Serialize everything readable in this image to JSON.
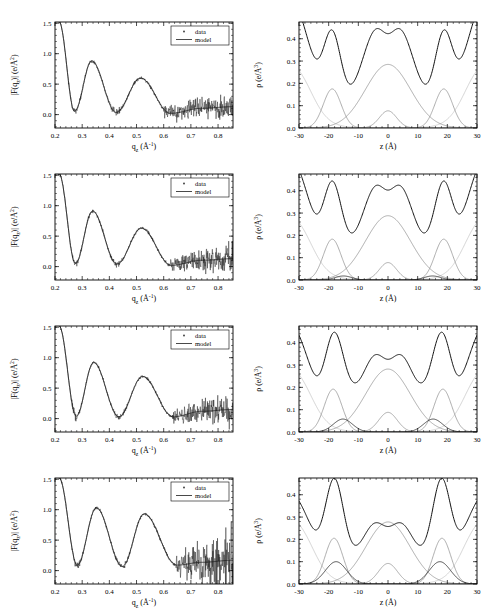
{
  "figure": {
    "rows": 4,
    "columns": 2,
    "width": 488,
    "height": 608
  },
  "colors": {
    "total_curve": "#111111",
    "component_curve": "#8a8a8a",
    "component_dark": "#222222",
    "component_light": "#c2c2c2",
    "axis": "#000000",
    "background": "#ffffff"
  },
  "legend": {
    "data_label": "data",
    "model_label": "model",
    "position": "top-right"
  },
  "left_axes": {
    "xlabel": "q",
    "xlabel_sub": "z",
    "xlabel_unit": "(Å",
    "xlabel_unit_sup": "-1",
    "xlabel_unit_close": ")",
    "xlabel_plain": "q_z (Å⁻¹)",
    "ylabel_plain": "|F(q_z)| (e/Å²)",
    "xticks": [
      "0.2",
      "0.3",
      "0.4",
      "0.5",
      "0.6",
      "0.7",
      "0.8"
    ],
    "xtick_values": [
      0.2,
      0.3,
      0.4,
      0.5,
      0.6,
      0.7,
      0.8
    ],
    "yticks": [
      "0.0",
      "0.5",
      "1.0",
      "1.5"
    ],
    "ytick_values": [
      0.0,
      0.5,
      1.0,
      1.5
    ],
    "xlim": [
      0.2,
      0.855
    ],
    "ylim": [
      -0.22,
      1.52
    ]
  },
  "right_axes": {
    "xlabel_plain": "z (Å)",
    "ylabel_plain": "ρ (e/Å³)",
    "xticks": [
      "-30",
      "-20",
      "-10",
      "0",
      "10",
      "20",
      "30"
    ],
    "xtick_values": [
      -30,
      -20,
      -10,
      0,
      10,
      20,
      30
    ],
    "yticks": [
      "0.0",
      "0.1",
      "0.2",
      "0.3",
      "0.4"
    ],
    "ytick_values": [
      0.0,
      0.1,
      0.2,
      0.3,
      0.4
    ],
    "xlim": [
      -30,
      30
    ],
    "ylim": [
      0.0,
      0.475
    ]
  },
  "chart_data": [
    {
      "id": "row1-left",
      "type": "line",
      "title": "",
      "xlabel": "q_z (Å⁻¹)",
      "ylabel": "|F(q_z)| (e/Å²)",
      "xlim": [
        0.2,
        0.855
      ],
      "ylim": [
        -0.22,
        1.52
      ],
      "grid": false,
      "legend": [
        "data",
        "model"
      ],
      "legend_position": "upper right",
      "model": {
        "peaks_qz": [
          0.335,
          0.515
        ],
        "peak_values": [
          0.88,
          0.6
        ],
        "minima_qz": [
          0.272,
          0.425,
          0.625
        ],
        "minimum_values": [
          0.055,
          0.035,
          0.02
        ],
        "start_value": 1.52,
        "end_value": 0.13,
        "noise_onset_qz": 0.6,
        "noise_amplitude": 0.13
      }
    },
    {
      "id": "row1-right",
      "type": "line",
      "title": "",
      "xlabel": "z (Å)",
      "ylabel": "ρ (e/Å³)",
      "xlim": [
        -30,
        30
      ],
      "ylim": [
        0.0,
        0.475
      ],
      "grid": false,
      "series": [
        {
          "name": "total",
          "style": "dark",
          "peak_z": [
            -18.5,
            18.5
          ],
          "peak_value": 0.435,
          "plateau": 0.327,
          "center_min": 0.232
        },
        {
          "name": "headgroup",
          "style": "grey",
          "center": [
            -18.8,
            18.8
          ],
          "amplitude": 0.175,
          "sigma": 3.0
        },
        {
          "name": "methylene",
          "style": "grey",
          "center": [
            0,
            0
          ],
          "amplitude": 0.285,
          "sigma": 7.6
        },
        {
          "name": "methyl",
          "style": "grey",
          "center": [
            0,
            0
          ],
          "amplitude": 0.077,
          "sigma": 2.9
        },
        {
          "name": "water",
          "style": "light",
          "center": [
            -26,
            26
          ],
          "amplitude": 0.327,
          "sigma": 5.5
        },
        {
          "name": "extra-bump",
          "style": "dark",
          "center": [
            -15,
            15
          ],
          "amplitude": 0.0,
          "sigma": 2.6
        }
      ]
    },
    {
      "id": "row2-left",
      "type": "line",
      "title": "",
      "xlabel": "q_z (Å⁻¹)",
      "ylabel": "|F(q_z)| (e/Å²)",
      "xlim": [
        0.2,
        0.855
      ],
      "ylim": [
        -0.22,
        1.52
      ],
      "grid": false,
      "legend": [
        "data",
        "model"
      ],
      "legend_position": "upper right",
      "model": {
        "peaks_qz": [
          0.338,
          0.518
        ],
        "peak_values": [
          0.91,
          0.63
        ],
        "minima_qz": [
          0.275,
          0.428,
          0.628
        ],
        "minimum_values": [
          0.05,
          0.04,
          0.02
        ],
        "start_value": 1.52,
        "end_value": 0.13,
        "noise_onset_qz": 0.615,
        "noise_amplitude": 0.145
      }
    },
    {
      "id": "row2-right",
      "type": "line",
      "title": "",
      "xlabel": "z (Å)",
      "ylabel": "ρ (e/Å³)",
      "xlim": [
        -30,
        30
      ],
      "ylim": [
        0.0,
        0.475
      ],
      "grid": false,
      "series": [
        {
          "name": "total",
          "style": "dark",
          "peak_z": [
            -18.5,
            18.5
          ],
          "peak_value": 0.442,
          "plateau": 0.327,
          "center_min": 0.232
        },
        {
          "name": "headgroup",
          "style": "grey",
          "center": [
            -18.8,
            18.8
          ],
          "amplitude": 0.183,
          "sigma": 3.0
        },
        {
          "name": "methylene",
          "style": "grey",
          "center": [
            0,
            0
          ],
          "amplitude": 0.288,
          "sigma": 7.6
        },
        {
          "name": "methyl",
          "style": "grey",
          "center": [
            0,
            0
          ],
          "amplitude": 0.078,
          "sigma": 2.9
        },
        {
          "name": "water",
          "style": "light",
          "center": [
            -26,
            26
          ],
          "amplitude": 0.327,
          "sigma": 5.5
        },
        {
          "name": "extra-bump",
          "style": "dark",
          "center": [
            -15,
            15
          ],
          "amplitude": 0.018,
          "sigma": 2.8
        }
      ]
    },
    {
      "id": "row3-left",
      "type": "line",
      "title": "",
      "xlabel": "q_z (Å⁻¹)",
      "ylabel": "|F(q_z)| (e/Å²)",
      "xlim": [
        0.2,
        0.855
      ],
      "ylim": [
        -0.22,
        1.52
      ],
      "grid": false,
      "legend": [
        "data",
        "model"
      ],
      "legend_position": "upper right",
      "model": {
        "peaks_qz": [
          0.342,
          0.522
        ],
        "peak_values": [
          0.92,
          0.69
        ],
        "minima_qz": [
          0.278,
          0.435,
          0.635
        ],
        "minimum_values": [
          0.04,
          0.03,
          0.03
        ],
        "start_value": 1.52,
        "end_value": 0.15,
        "noise_onset_qz": 0.63,
        "noise_amplitude": 0.155
      }
    },
    {
      "id": "row3-right",
      "type": "line",
      "title": "",
      "xlabel": "z (Å)",
      "ylabel": "ρ (e/Å³)",
      "xlim": [
        -30,
        30
      ],
      "ylim": [
        0.0,
        0.475
      ],
      "grid": false,
      "series": [
        {
          "name": "total",
          "style": "dark",
          "peak_z": [
            -18.2,
            18.2
          ],
          "peak_value": 0.447,
          "plateau": 0.327,
          "center_min": 0.232
        },
        {
          "name": "headgroup",
          "style": "grey",
          "center": [
            -18.5,
            18.5
          ],
          "amplitude": 0.192,
          "sigma": 3.0
        },
        {
          "name": "methylene",
          "style": "grey",
          "center": [
            0,
            0
          ],
          "amplitude": 0.282,
          "sigma": 7.5
        },
        {
          "name": "methyl",
          "style": "grey",
          "center": [
            0,
            0
          ],
          "amplitude": 0.088,
          "sigma": 3.1
        },
        {
          "name": "water",
          "style": "light",
          "center": [
            -26,
            26
          ],
          "amplitude": 0.327,
          "sigma": 5.5
        },
        {
          "name": "extra-bump",
          "style": "dark",
          "center": [
            -15.2,
            15.2
          ],
          "amplitude": 0.058,
          "sigma": 3.2
        }
      ]
    },
    {
      "id": "row4-left",
      "type": "line",
      "title": "",
      "xlabel": "q_z (Å⁻¹)",
      "ylabel": "|F(q_z)| (e/Å²)",
      "xlim": [
        0.2,
        0.855
      ],
      "ylim": [
        -0.22,
        1.52
      ],
      "grid": false,
      "legend": [
        "data",
        "model"
      ],
      "legend_position": "upper right",
      "model": {
        "peaks_qz": [
          0.352,
          0.528
        ],
        "peak_values": [
          1.03,
          0.93
        ],
        "minima_qz": [
          0.282,
          0.448,
          0.648
        ],
        "minimum_values": [
          0.09,
          0.07,
          0.09
        ],
        "start_value": 1.52,
        "end_value": 0.17,
        "noise_onset_qz": 0.645,
        "noise_amplitude": 0.3
      }
    },
    {
      "id": "row4-right",
      "type": "line",
      "title": "",
      "xlabel": "z (Å)",
      "ylabel": "ρ (e/Å³)",
      "xlim": [
        -30,
        30
      ],
      "ylim": [
        0.0,
        0.475
      ],
      "grid": false,
      "series": [
        {
          "name": "total",
          "style": "dark",
          "peak_z": [
            -17.8,
            17.8
          ],
          "peak_value": 0.472,
          "plateau": 0.327,
          "center_min": 0.224
        },
        {
          "name": "headgroup",
          "style": "grey",
          "center": [
            -18.2,
            18.2
          ],
          "amplitude": 0.205,
          "sigma": 3.0
        },
        {
          "name": "methylene",
          "style": "grey",
          "center": [
            0,
            0
          ],
          "amplitude": 0.278,
          "sigma": 7.4
        },
        {
          "name": "methyl",
          "style": "grey",
          "center": [
            0,
            0
          ],
          "amplitude": 0.092,
          "sigma": 3.2
        },
        {
          "name": "water",
          "style": "light",
          "center": [
            -25.5,
            25.5
          ],
          "amplitude": 0.327,
          "sigma": 5.4
        },
        {
          "name": "extra-bump",
          "style": "dark",
          "center": [
            -17.5,
            17.5
          ],
          "amplitude": 0.1,
          "sigma": 3.6
        }
      ]
    }
  ]
}
